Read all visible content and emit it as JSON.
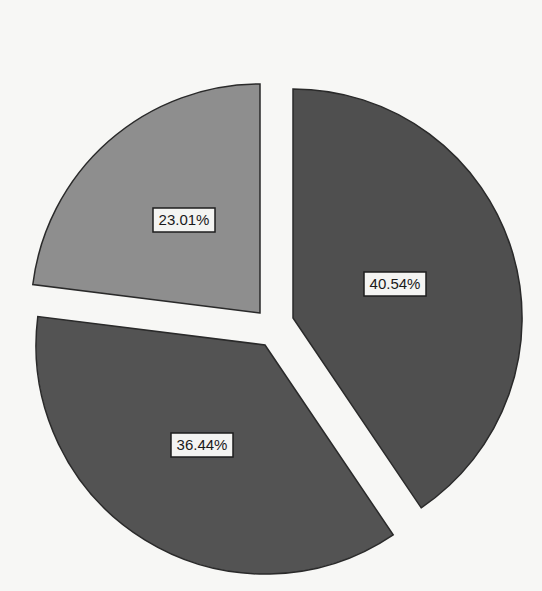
{
  "chart_data": {
    "type": "pie",
    "title": "",
    "exploded": true,
    "start_angle_deg": -90,
    "direction": "clockwise",
    "legend": "none",
    "slices": [
      {
        "label": "40.54%",
        "value": 40.54,
        "color": "#4f4f4f",
        "center": [
          293,
          318
        ],
        "label_pos": [
          395,
          284
        ]
      },
      {
        "label": "36.44%",
        "value": 36.44,
        "color": "#535353",
        "center": [
          265,
          345
        ],
        "label_pos": [
          202,
          445
        ]
      },
      {
        "label": "23.01%",
        "value": 23.01,
        "color": "#8e8e8e",
        "center": [
          260,
          313
        ],
        "label_pos": [
          184,
          220
        ]
      }
    ],
    "radius": 229
  }
}
